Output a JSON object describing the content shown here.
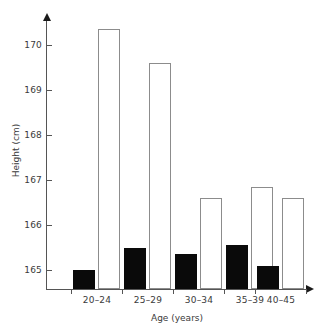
{
  "chart_data": {
    "type": "bar",
    "title": "",
    "subtitle": "",
    "xlabel": "Age (years)",
    "ylabel": "Height (cm)",
    "categories": [
      "20–24",
      "25–29",
      "30–34",
      "35–39",
      "40–45"
    ],
    "series": [
      {
        "name": "filled",
        "style": "solid black bar",
        "color": "#0a0a0a",
        "values": [
          165.0,
          165.5,
          165.35,
          165.55,
          165.1
        ]
      },
      {
        "name": "hollow",
        "style": "white bar with grey outline",
        "color": "#ffffff",
        "border_color": "#8c8c8c",
        "values": [
          170.35,
          169.6,
          166.6,
          166.85,
          166.6
        ]
      }
    ],
    "ylim": [
      164.58,
      170.55
    ],
    "yticks": [
      165,
      166,
      167,
      168,
      169,
      170
    ],
    "ytick_labels": [
      "165",
      "166",
      "167",
      "168",
      "169",
      "170"
    ],
    "grid": false,
    "legend": false,
    "legend_position": "none",
    "axis_color": "#555555",
    "text_color": "#3a3a3a",
    "background": "#ffffff"
  }
}
